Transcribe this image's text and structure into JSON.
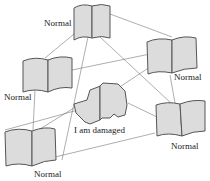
{
  "diagram": {
    "type": "network",
    "nodes": [
      {
        "id": "top",
        "kind": "book",
        "label": "Normal"
      },
      {
        "id": "left",
        "kind": "book",
        "label": "Normal"
      },
      {
        "id": "right",
        "kind": "book",
        "label": "Normal"
      },
      {
        "id": "bottom-left",
        "kind": "book",
        "label": "Normal"
      },
      {
        "id": "bottom-right",
        "kind": "book",
        "label": "Normal"
      },
      {
        "id": "center",
        "kind": "damaged-book",
        "label": "I am damaged"
      }
    ],
    "colors": {
      "book_fill": "#dcdcdc",
      "stroke": "#555555",
      "edge": "#777777"
    }
  }
}
